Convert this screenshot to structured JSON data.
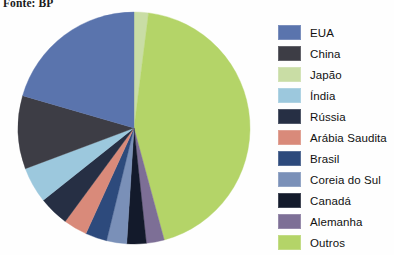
{
  "source_note": "Fonte: BP",
  "chart_data": {
    "type": "pie",
    "title": "",
    "legend_position": "right",
    "center": {
      "x": 134,
      "y": 128
    },
    "radius": 116,
    "start_angle_deg": -90,
    "direction": "clockwise",
    "categories": [
      "EUA",
      "China",
      "Japão",
      "Índia",
      "Rússia",
      "Arábia Saudita",
      "Brasil",
      "Coreia do Sul",
      "Canadá",
      "Alemanha",
      "Outros"
    ],
    "values": [
      20.5,
      10.2,
      2.0,
      5.0,
      4.2,
      3.3,
      3.0,
      2.8,
      2.7,
      2.5,
      43.8
    ],
    "unit": "%",
    "colors": [
      "#5a74ad",
      "#3d3d45",
      "#c9dda5",
      "#9cc8dd",
      "#262f44",
      "#d98a7a",
      "#2d4a7c",
      "#7a90b8",
      "#131a2b",
      "#7d6f96",
      "#b4d468"
    ],
    "slices": [
      {
        "label": "Japão",
        "value": 2.0,
        "color": "#c9dda5"
      },
      {
        "label": "Outros",
        "value": 43.8,
        "color": "#b4d468"
      },
      {
        "label": "Alemanha",
        "value": 2.5,
        "color": "#7d6f96"
      },
      {
        "label": "Canadá",
        "value": 2.7,
        "color": "#131a2b"
      },
      {
        "label": "Coreia do Sul",
        "value": 2.8,
        "color": "#7a90b8"
      },
      {
        "label": "Brasil",
        "value": 3.0,
        "color": "#2d4a7c"
      },
      {
        "label": "Arábia Saudita",
        "value": 3.3,
        "color": "#d98a7a"
      },
      {
        "label": "Rússia",
        "value": 4.2,
        "color": "#262f44"
      },
      {
        "label": "Índia",
        "value": 5.0,
        "color": "#9cc8dd"
      },
      {
        "label": "China",
        "value": 10.2,
        "color": "#3d3d45"
      },
      {
        "label": "EUA",
        "value": 20.5,
        "color": "#5a74ad"
      }
    ]
  },
  "legend": {
    "items": [
      {
        "label": "EUA",
        "color": "#5a74ad"
      },
      {
        "label": "China",
        "color": "#3d3d45"
      },
      {
        "label": "Japão",
        "color": "#c9dda5"
      },
      {
        "label": "Índia",
        "color": "#9cc8dd"
      },
      {
        "label": "Rússia",
        "color": "#262f44"
      },
      {
        "label": "Arábia Saudita",
        "color": "#d98a7a"
      },
      {
        "label": "Brasil",
        "color": "#2d4a7c"
      },
      {
        "label": "Coreia do Sul",
        "color": "#7a90b8"
      },
      {
        "label": "Canadá",
        "color": "#131a2b"
      },
      {
        "label": "Alemanha",
        "color": "#7d6f96"
      },
      {
        "label": "Outros",
        "color": "#b4d468"
      }
    ]
  }
}
